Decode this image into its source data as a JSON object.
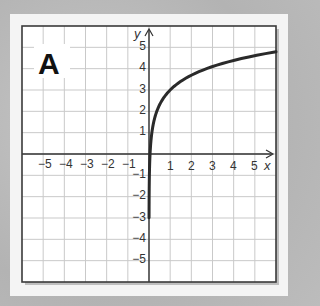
{
  "panel": {
    "label": "A"
  },
  "axes": {
    "x_label": "x",
    "y_label": "y",
    "x_ticks_neg": [
      "−5",
      "−4",
      "−3",
      "−2",
      "−1"
    ],
    "x_ticks_pos": [
      "1",
      "2",
      "3",
      "4",
      "5"
    ],
    "y_ticks_pos": [
      "1",
      "2",
      "3",
      "4",
      "5"
    ],
    "y_ticks_neg": [
      "−1",
      "−2",
      "−3",
      "−4",
      "−5"
    ]
  },
  "colors": {
    "curve": "#2a2a2a",
    "grid": "#c9c9c9",
    "frame": "#3a3a3a",
    "background": "#ffffff"
  },
  "chart_data": {
    "type": "line",
    "title": "A",
    "xlabel": "x",
    "ylabel": "y",
    "xlim": [
      -6,
      6
    ],
    "ylim": [
      -6,
      6
    ],
    "grid": true,
    "x_ticks": [
      -5,
      -4,
      -3,
      -2,
      -1,
      1,
      2,
      3,
      4,
      5
    ],
    "y_ticks": [
      -5,
      -4,
      -3,
      -2,
      -1,
      1,
      2,
      3,
      4,
      5
    ],
    "series": [
      {
        "name": "curve",
        "description": "logarithmic curve approx y = ln(x) + 3, vertical asymptote at x = 0",
        "x": [
          0.003,
          0.01,
          0.05,
          0.1,
          0.25,
          0.5,
          1,
          2,
          3,
          4,
          5,
          6
        ],
        "y": [
          -6,
          -1.6,
          0.0,
          0.7,
          1.6,
          2.3,
          3.0,
          3.7,
          4.1,
          4.4,
          4.6,
          4.8
        ]
      }
    ]
  }
}
